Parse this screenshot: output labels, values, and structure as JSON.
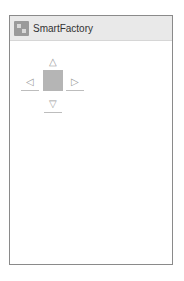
{
  "app": {
    "title": "SmartFactory",
    "icon": "app-logo-icon"
  },
  "dpad": {
    "up": {
      "glyph": "△",
      "icon": "arrow-up-icon"
    },
    "left": {
      "glyph": "◁",
      "icon": "arrow-left-icon"
    },
    "right": {
      "glyph": "▷",
      "icon": "arrow-right-icon"
    },
    "down": {
      "glyph": "▽",
      "icon": "arrow-down-icon"
    },
    "center_color": "#b5b5b5"
  }
}
